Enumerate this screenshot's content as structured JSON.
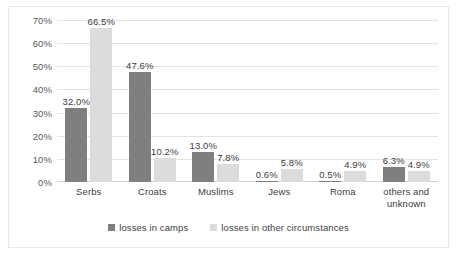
{
  "chart_data": {
    "type": "bar",
    "title": "",
    "xlabel": "",
    "ylabel": "",
    "ylim": [
      0,
      70
    ],
    "ytick_step": 10,
    "grid": true,
    "legend_position": "bottom",
    "categories": [
      "Serbs",
      "Croats",
      "Muslims",
      "Jews",
      "Roma",
      "others and unknown"
    ],
    "ytick_labels": [
      "70%",
      "60%",
      "50%",
      "40%",
      "30%",
      "20%",
      "10%",
      "0%"
    ],
    "ytick_values": [
      70,
      60,
      50,
      40,
      30,
      20,
      10,
      0
    ],
    "series": [
      {
        "name": "losses in camps",
        "color": "#7f7f7f",
        "values": [
          32.0,
          47.6,
          13.0,
          0.6,
          0.5,
          6.3
        ],
        "labels": [
          "32.0%",
          "47.6%",
          "13.0%",
          "0.6%",
          "0.5%",
          "6.3%"
        ]
      },
      {
        "name": "losses in other circumstances",
        "color": "#dcdcdc",
        "values": [
          66.5,
          10.2,
          7.8,
          5.8,
          4.9,
          4.9
        ],
        "labels": [
          "66.5%",
          "10.2%",
          "7.8%",
          "5.8%",
          "4.9%",
          "4.9%"
        ]
      }
    ]
  }
}
